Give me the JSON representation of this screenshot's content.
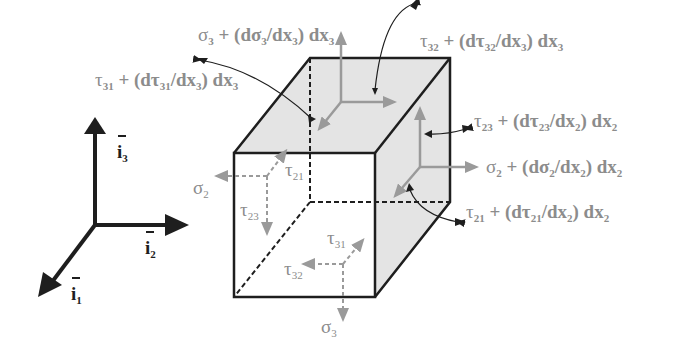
{
  "figure": {
    "colors": {
      "background": "#ffffff",
      "edge": "#1e1e1e",
      "shaded_face": "#e4e4e4",
      "stress_arrow": "#9a9a9a",
      "label_text": "#8c8c8c",
      "axis": "#1e1e1e"
    }
  },
  "axes": {
    "i1": {
      "base": "i",
      "sub": "1"
    },
    "i2": {
      "base": "i",
      "sub": "2"
    },
    "i3": {
      "base": "i",
      "sub": "3"
    }
  },
  "labels": {
    "top_sigma3": {
      "sym": "σ",
      "sub": "3",
      "mid": " + (dσ",
      "sub2": "3",
      "mid2": "/dx",
      "sub3": "3",
      "tail": ") dx",
      "sub4": "3"
    },
    "top_tau32": {
      "sym": "τ",
      "sub": "32",
      "mid": " + (dτ",
      "sub2": "32",
      "mid2": "/dx",
      "sub3": "3",
      "tail": ") dx",
      "sub4": "3"
    },
    "top_tau31": {
      "sym": "τ",
      "sub": "31",
      "mid": " + (dτ",
      "sub2": "31",
      "mid2": "/dx",
      "sub3": "3",
      "tail": ") dx",
      "sub4": "3"
    },
    "right_tau23": {
      "sym": "τ",
      "sub": "23",
      "mid": " + (dτ",
      "sub2": "23",
      "mid2": "/dx",
      "sub3": "2",
      "tail": ") dx",
      "sub4": "2"
    },
    "right_sigma2": {
      "sym": "σ",
      "sub": "2",
      "mid": " + (dσ",
      "sub2": "2",
      "mid2": "/dx",
      "sub3": "2",
      "tail": ") dx",
      "sub4": "2"
    },
    "right_tau21": {
      "sym": "τ",
      "sub": "21",
      "mid": " + (dτ",
      "sub2": "21",
      "mid2": "/dx",
      "sub3": "2",
      "tail": ") dx",
      "sub4": "2"
    },
    "back_sigma2": {
      "sym": "σ",
      "sub": "2"
    },
    "back_tau21": {
      "sym": "τ",
      "sub": "21"
    },
    "back_tau23": {
      "sym": "τ",
      "sub": "23"
    },
    "bottom_tau31": {
      "sym": "τ",
      "sub": "31"
    },
    "bottom_tau32": {
      "sym": "τ",
      "sub": "32"
    },
    "bottom_sigma3": {
      "sym": "σ",
      "sub": "3"
    }
  }
}
